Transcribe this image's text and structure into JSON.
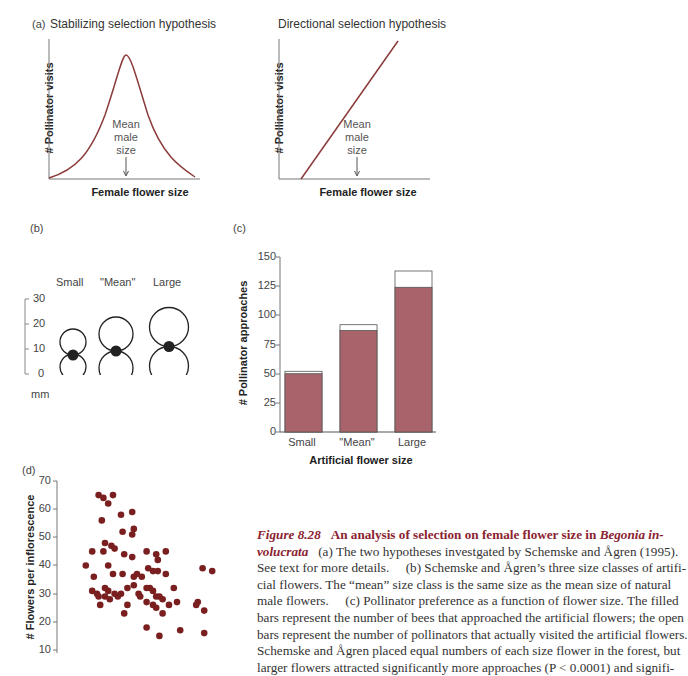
{
  "panel_a": {
    "label": "(a)",
    "left": {
      "title": "Stabilizing selection hypothesis",
      "ylabel": "# Pollinator visits",
      "xlabel": "Female flower size",
      "annotation": [
        "Mean",
        "male",
        "size"
      ]
    },
    "right": {
      "title": "Directional selection hypothesis",
      "ylabel": "# Pollinator visits",
      "xlabel": "Female flower size",
      "annotation": [
        "Mean",
        "male",
        "size"
      ]
    }
  },
  "panel_b": {
    "label": "(b)",
    "columns": [
      "Small",
      "\"Mean\"",
      "Large"
    ],
    "scale_ticks": [
      "30",
      "20",
      "10",
      "0"
    ],
    "unit": "mm"
  },
  "panel_c": {
    "label": "(c)",
    "ylabel": "# Pollinator approaches",
    "xlabel": "Artificial flower size",
    "yticks": [
      "150",
      "125",
      "100",
      "75",
      "50",
      "25",
      "0"
    ],
    "categories": [
      "Small",
      "\"Mean\"",
      "Large"
    ]
  },
  "panel_d": {
    "label": "(d)",
    "ylabel": "# Flowers per inflorescence",
    "yticks": [
      "70",
      "60",
      "50",
      "40",
      "30",
      "20",
      "10"
    ]
  },
  "caption": {
    "fig_label": "Figure 8.28",
    "heading": "An analysis of selection on female flower size in",
    "species_part1": "Begonia in-",
    "species_part2": "volucrata",
    "line1_rest": "(a) The two hypotheses investgated by Schemske and Ågren (1995).",
    "line2": "See text for more details.     (b) Schemske and Ågren’s three size classes of artifi-",
    "line3": "cial flowers. The “mean” size class is the same size as the mean size of natural",
    "line4": "male flowers.     (c) Pollinator preference as a function of flower size. The filled",
    "line5": "bars represent the number of bees that approached the artificial flowers; the open",
    "line6": "bars represent the number of pollinators that actually visited the artificial flowers.",
    "line7": "Schemske and Ågren placed equal numbers of each size flower in the forest, but",
    "line8": "larger flowers attracted significantly more approaches (P < 0.0001) and signifi-"
  },
  "colors": {
    "curve": "#8b3a3a",
    "bar_fill": "#a8636b",
    "dot": "#7a1f1f",
    "caption_accent": "#8b2331"
  },
  "chart_data": [
    {
      "type": "line",
      "title": "Stabilizing selection hypothesis",
      "xlabel": "Female flower size",
      "ylabel": "# Pollinator visits",
      "shape": "bell curve peaking at mean male size",
      "annotation": "Mean male size (arrow at curve peak)"
    },
    {
      "type": "line",
      "title": "Directional selection hypothesis",
      "xlabel": "Female flower size",
      "ylabel": "# Pollinator visits",
      "shape": "monotonic increasing straight line",
      "annotation": "Mean male size (arrow at center of x range)"
    },
    {
      "type": "bar",
      "title": "",
      "xlabel": "Artificial flower size",
      "ylabel": "# Pollinator approaches",
      "categories": [
        "Small",
        "\"Mean\"",
        "Large"
      ],
      "series": [
        {
          "name": "Approaches (filled)",
          "values": [
            50,
            87,
            124
          ]
        },
        {
          "name": "Visits / total (open top)",
          "values": [
            52,
            92,
            138
          ]
        }
      ],
      "ylim": [
        0,
        150
      ],
      "yticks": [
        0,
        25,
        50,
        75,
        100,
        125,
        150
      ]
    },
    {
      "type": "scatter",
      "title": "",
      "xlabel": "",
      "ylabel": "# Flowers per inflorescence",
      "ylim": [
        10,
        70
      ],
      "yticks": [
        10,
        20,
        30,
        40,
        50,
        60,
        70
      ],
      "x_note": "x values are relative horizontal positions (0-100); x-axis ticks not visible",
      "points": [
        [
          26,
          65
        ],
        [
          29,
          64
        ],
        [
          35,
          65
        ],
        [
          32,
          62
        ],
        [
          40,
          58
        ],
        [
          28,
          56
        ],
        [
          47,
          59
        ],
        [
          41,
          52
        ],
        [
          48,
          53
        ],
        [
          47,
          51
        ],
        [
          30,
          48
        ],
        [
          22,
          45
        ],
        [
          34,
          47
        ],
        [
          29,
          45
        ],
        [
          36,
          46
        ],
        [
          42,
          44
        ],
        [
          47,
          43
        ],
        [
          56,
          45
        ],
        [
          62,
          44
        ],
        [
          68,
          45
        ],
        [
          63,
          42
        ],
        [
          18,
          40
        ],
        [
          32,
          40
        ],
        [
          41,
          37
        ],
        [
          50,
          37
        ],
        [
          35,
          37
        ],
        [
          23,
          36
        ],
        [
          48,
          36
        ],
        [
          53,
          36
        ],
        [
          57,
          39
        ],
        [
          60,
          38
        ],
        [
          63,
          38
        ],
        [
          68,
          37
        ],
        [
          91,
          39
        ],
        [
          97,
          38
        ],
        [
          22,
          31
        ],
        [
          30,
          32
        ],
        [
          32,
          31
        ],
        [
          44,
          32
        ],
        [
          48,
          33
        ],
        [
          51,
          30
        ],
        [
          52,
          29
        ],
        [
          56,
          32
        ],
        [
          58,
          32
        ],
        [
          60,
          31
        ],
        [
          36,
          30
        ],
        [
          40,
          30
        ],
        [
          25,
          30
        ],
        [
          26,
          29
        ],
        [
          30,
          29
        ],
        [
          38,
          29
        ],
        [
          62,
          29
        ],
        [
          64,
          29
        ],
        [
          66,
          28
        ],
        [
          73,
          32
        ],
        [
          75,
          27
        ],
        [
          87,
          26
        ],
        [
          88,
          27
        ],
        [
          92,
          24
        ],
        [
          27,
          26
        ],
        [
          33,
          28
        ],
        [
          44,
          26
        ],
        [
          56,
          27
        ],
        [
          60,
          26
        ],
        [
          62,
          25
        ],
        [
          70,
          26
        ],
        [
          42,
          23
        ],
        [
          66,
          23
        ],
        [
          56,
          18
        ],
        [
          64,
          15
        ],
        [
          77,
          17
        ],
        [
          92,
          16
        ]
      ]
    }
  ]
}
